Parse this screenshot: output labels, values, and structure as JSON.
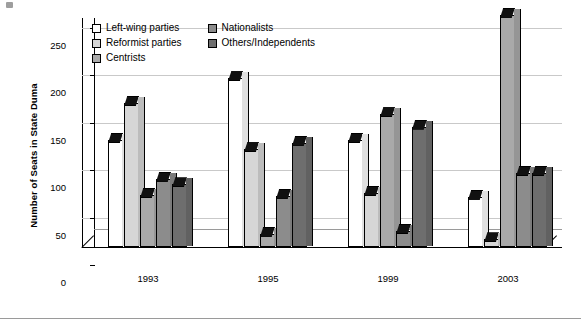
{
  "chart_data": {
    "type": "bar",
    "title": "",
    "xlabel": "",
    "ylabel": "Number of Seats in State Duma",
    "categories": [
      "1993",
      "1995",
      "1999",
      "2003"
    ],
    "ylim": [
      0,
      250
    ],
    "yticks": [
      0,
      50,
      100,
      150,
      200,
      250
    ],
    "grid": true,
    "legend_position": "top-left-inside",
    "style": "3d-grouped-columns",
    "series": [
      {
        "name": "Left-wing parties",
        "color": "#ffffff",
        "values": [
          113,
          178,
          113,
          53
        ]
      },
      {
        "name": "Reformist parties",
        "color": "#d6d6d6",
        "values": [
          152,
          103,
          57,
          8
        ]
      },
      {
        "name": "Centrists",
        "color": "#a9a9a9",
        "values": [
          55,
          14,
          140,
          245
        ]
      },
      {
        "name": "Nationalists",
        "color": "#8c8c8c",
        "values": [
          72,
          54,
          17,
          78
        ]
      },
      {
        "name": "Others/Independents",
        "color": "#6e6e6e",
        "values": [
          66,
          110,
          127,
          78
        ]
      }
    ]
  },
  "axis": {
    "y_title": "Number of Seats in State Duma",
    "y_tick_labels": [
      "0",
      "50",
      "100",
      "150",
      "200",
      "250"
    ],
    "x_tick_labels": [
      "1993",
      "1995",
      "1999",
      "2003"
    ]
  },
  "legend": {
    "column_one": [
      "Left-wing parties",
      "Reformist parties",
      "Centrists"
    ],
    "column_two": [
      "Nationalists",
      "Others/Independents"
    ]
  }
}
